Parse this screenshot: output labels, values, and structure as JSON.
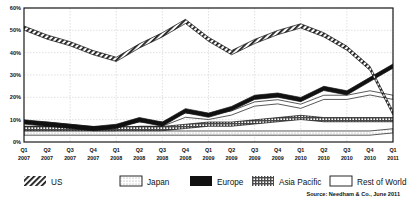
{
  "chart_data": {
    "type": "line",
    "title": "",
    "subtitle": "",
    "xlabel": "",
    "ylabel": "",
    "ylim": [
      0,
      60
    ],
    "yticks": [
      0,
      10,
      20,
      30,
      40,
      50,
      60
    ],
    "ytick_labels": [
      "0%",
      "10%",
      "20%",
      "30%",
      "40%",
      "50%",
      "60%"
    ],
    "grid": true,
    "legend_position": "bottom",
    "categories": [
      "Q1 2007",
      "Q2 2007",
      "Q3 2007",
      "Q4 2007",
      "Q1 2008",
      "Q2 2008",
      "Q3 2008",
      "Q4 2008",
      "Q1 2009",
      "Q2 2009",
      "Q3 2009",
      "Q4 2009",
      "Q1 2010",
      "Q2 2010",
      "Q3 2010",
      "Q4 2010",
      "Q1 2011"
    ],
    "xtick_lines": [
      [
        "Q1",
        "2007"
      ],
      [
        "Q2",
        "2007"
      ],
      [
        "Q3",
        "2007"
      ],
      [
        "Q4",
        "2007"
      ],
      [
        "Q1",
        "2008"
      ],
      [
        "Q2",
        "2008"
      ],
      [
        "Q3",
        "2008"
      ],
      [
        "Q4",
        "2008"
      ],
      [
        "Q1",
        "2009"
      ],
      [
        "Q2",
        "2009"
      ],
      [
        "Q3",
        "2009"
      ],
      [
        "Q4",
        "2009"
      ],
      [
        "Q1",
        "2010"
      ],
      [
        "Q2",
        "2010"
      ],
      [
        "Q3",
        "2010"
      ],
      [
        "Q4",
        "2010"
      ],
      [
        "Q1",
        "2011"
      ]
    ],
    "series": [
      {
        "name": "US",
        "pattern": "diagonal-hatch",
        "color": "#1a1a1a",
        "values": [
          51,
          47,
          44,
          40,
          37,
          43,
          48,
          54,
          46,
          40,
          45,
          49,
          52,
          48,
          42,
          33,
          13
        ]
      },
      {
        "name": "Japan",
        "pattern": "light-dots",
        "color": "#cfcfcf",
        "values": [
          4,
          4,
          4,
          4,
          4,
          4,
          4,
          4,
          4,
          4,
          4,
          4,
          4,
          4,
          4,
          4,
          5
        ]
      },
      {
        "name": "Europe",
        "pattern": "solid",
        "color": "#111111",
        "values": [
          9,
          8,
          7,
          6,
          7,
          10,
          8,
          14,
          12,
          15,
          20,
          21,
          19,
          24,
          22,
          28,
          34
        ]
      },
      {
        "name": "Asia Pacific",
        "pattern": "grid-hatch",
        "color": "#6b6b6b",
        "values": [
          6,
          6,
          6,
          6,
          6,
          6,
          6,
          7,
          8,
          8,
          9,
          10,
          11,
          10,
          10,
          10,
          10
        ]
      },
      {
        "name": "Rest of World",
        "pattern": "white",
        "color": "#ffffff",
        "values": [
          8,
          8,
          7,
          6,
          6,
          8,
          8,
          12,
          11,
          13,
          17,
          18,
          16,
          20,
          20,
          22,
          20
        ]
      }
    ]
  },
  "legend": {
    "items": [
      {
        "label": "US",
        "swatch": "diagonal-hatch"
      },
      {
        "label": "Japan",
        "swatch": "light-dots"
      },
      {
        "label": "Europe",
        "swatch": "solid-black"
      },
      {
        "label": "Asia Pacific",
        "swatch": "grid-hatch"
      },
      {
        "label": "Rest of World",
        "swatch": "white-outline"
      }
    ]
  },
  "source": {
    "text": "Source: Needham & Co., June 2011"
  }
}
